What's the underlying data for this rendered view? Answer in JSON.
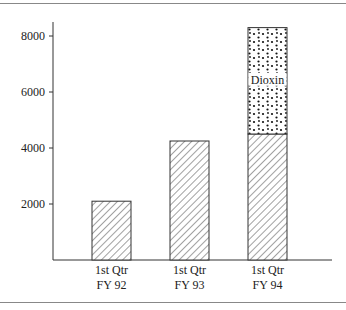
{
  "chart_data": {
    "type": "bar",
    "stacked": true,
    "title": "",
    "xlabel": "",
    "ylabel": "",
    "ylim": [
      0,
      8500
    ],
    "yticks": [
      2000,
      4000,
      6000,
      8000
    ],
    "grid": false,
    "legend": "none",
    "categories": [
      "1st Qtr FY 92",
      "1st Qtr FY 93",
      "1st Qtr FY 94"
    ],
    "category_lines": [
      [
        "1st Qtr",
        "FY 92"
      ],
      [
        "1st Qtr",
        "FY 93"
      ],
      [
        "1st Qtr",
        "FY 94"
      ]
    ],
    "series": [
      {
        "name": "Base",
        "pattern": "diagonal-hatch",
        "values": [
          2100,
          4250,
          4500
        ]
      },
      {
        "name": "Dioxin",
        "pattern": "dots",
        "values": [
          0,
          0,
          3800
        ]
      }
    ],
    "annotations": [
      {
        "text": "Dioxin",
        "category": "1st Qtr FY 94",
        "series": "Dioxin"
      }
    ]
  }
}
